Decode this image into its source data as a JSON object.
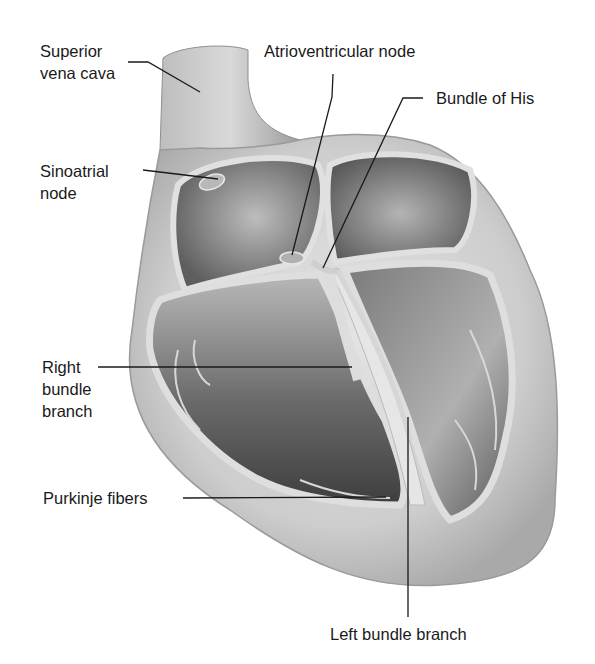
{
  "figure": {
    "colors": {
      "outer_wall": "#cfcfcf",
      "wall_shadow": "#8a8a8a",
      "chamber_dark": "#5a5a5a",
      "chamber_mid": "#9a9a9a",
      "septum": "#dcdcdc",
      "leader_line": "#1a1a1a"
    }
  },
  "labels": {
    "superior_vena_cava": {
      "line1": "Superior",
      "line2": "vena cava"
    },
    "sinoatrial_node": {
      "line1": "Sinoatrial",
      "line2": "node"
    },
    "atrioventricular_node": {
      "text": "Atrioventricular node"
    },
    "bundle_of_his": {
      "text": "Bundle of His"
    },
    "right_bundle_branch": {
      "line1": "Right",
      "line2": "bundle",
      "line3": "branch"
    },
    "purkinje_fibers": {
      "text": "Purkinje fibers"
    },
    "left_bundle_branch": {
      "text": "Left bundle branch"
    }
  }
}
